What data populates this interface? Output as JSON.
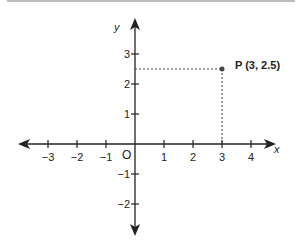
{
  "diagram": {
    "x_axis_label": "x",
    "y_axis_label": "y",
    "origin_label": "O",
    "x_ticks": [
      {
        "value": -3,
        "label": "−3"
      },
      {
        "value": -2,
        "label": "−2"
      },
      {
        "value": -1,
        "label": "−1"
      },
      {
        "value": 1,
        "label": "1"
      },
      {
        "value": 2,
        "label": "2"
      },
      {
        "value": 3,
        "label": "3"
      },
      {
        "value": 4,
        "label": "4"
      }
    ],
    "y_ticks": [
      {
        "value": 3,
        "label": "3"
      },
      {
        "value": 2,
        "label": "2"
      },
      {
        "value": 1,
        "label": "1"
      },
      {
        "value": -1,
        "label": "−1"
      },
      {
        "value": -2,
        "label": "−2"
      }
    ],
    "point": {
      "name": "P",
      "x": 3,
      "y": 2.5,
      "label": "P (3, 2.5)"
    },
    "colors": {
      "axis": "#222222",
      "point": "#444444",
      "dashed": "#444444",
      "top_bar": "#bdbdbd"
    }
  }
}
